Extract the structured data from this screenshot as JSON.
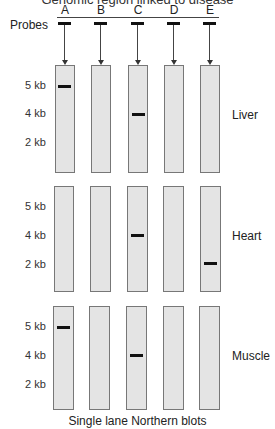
{
  "title": "Genomic region linked to disease",
  "probes_label": "Probes",
  "caption": "Single lane Northern blots",
  "probes": [
    "A",
    "B",
    "C",
    "D",
    "E"
  ],
  "size_markers": [
    "5 kb",
    "4 kb",
    "2 kb"
  ],
  "panels": [
    {
      "tissue": "Liver",
      "bands": {
        "A": "5 kb",
        "C": "4 kb"
      }
    },
    {
      "tissue": "Heart",
      "bands": {
        "C": "4 kb",
        "E": "2 kb"
      }
    },
    {
      "tissue": "Muscle",
      "bands": {
        "A": "5 kb",
        "C": "4 kb"
      }
    }
  ]
}
